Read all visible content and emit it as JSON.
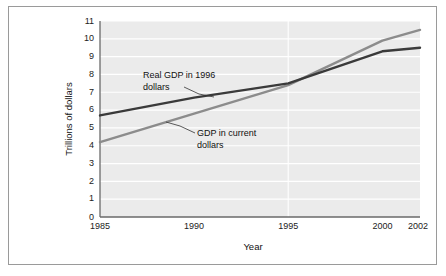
{
  "figure": {
    "background_color": "#ffffff",
    "border_color": "#9a9a9a"
  },
  "chart_data": {
    "type": "line",
    "title": "",
    "subtitle": "",
    "xlabel": "Year",
    "ylabel": "Trillions of dollars",
    "xlim": [
      1985,
      2002
    ],
    "ylim": [
      0,
      11
    ],
    "grid": "horizontal",
    "legend_position": "inline-annotations",
    "plot_background_color": "#ebebeb",
    "gridline_color": "#ffffff",
    "x_tick_labels": [
      "1985",
      "1990",
      "1995",
      "2000",
      "2002"
    ],
    "x_ticks": [
      1985,
      1990,
      1995,
      2000,
      2002
    ],
    "y_tick_labels": [
      "0",
      "1",
      "2",
      "3",
      "4",
      "5",
      "6",
      "7",
      "8",
      "9",
      "10",
      "11"
    ],
    "y_ticks": [
      0,
      1,
      2,
      3,
      4,
      5,
      6,
      7,
      8,
      9,
      10,
      11
    ],
    "series": [
      {
        "name": "Real GDP in 1996 dollars",
        "color": "#3a3a3a",
        "x": [
          1985,
          1990,
          1995,
          2000,
          2002
        ],
        "values": [
          5.7,
          6.7,
          7.5,
          9.3,
          9.5
        ]
      },
      {
        "name": "GDP in current dollars",
        "color": "#8c8c8c",
        "x": [
          1985,
          1990,
          1995,
          2000,
          2002
        ],
        "values": [
          4.2,
          5.8,
          7.4,
          9.9,
          10.5
        ]
      }
    ],
    "annotations": [
      {
        "id": "real-gdp",
        "line1": "Real GDP in 1996",
        "line2": "dollars",
        "points_to_series": "Real GDP in 1996 dollars"
      },
      {
        "id": "current-gdp",
        "line1": "GDP in current",
        "line2": "dollars",
        "points_to_series": "GDP in current dollars"
      }
    ]
  }
}
